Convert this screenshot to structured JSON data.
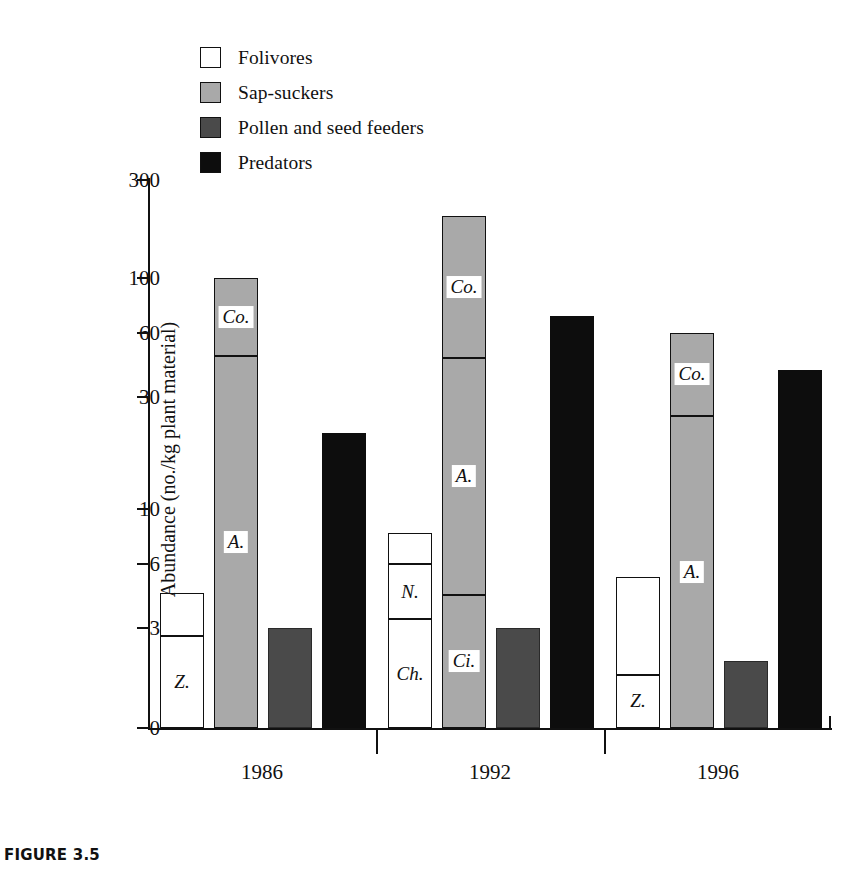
{
  "caption": "FIGURE 3.5",
  "legend": {
    "position": "top-left",
    "items": [
      {
        "label": "Folivores",
        "color": "#ffffff",
        "swatch": "sw-white"
      },
      {
        "label": "Sap-suckers",
        "color": "#a9a9a9",
        "swatch": "sw-light"
      },
      {
        "label": "Pollen and seed feeders",
        "color": "#4a4a4a",
        "swatch": "sw-dark"
      },
      {
        "label": "Predators",
        "color": "#0d0d0d",
        "swatch": "sw-black"
      }
    ]
  },
  "chart_data": {
    "type": "bar",
    "title": "",
    "xlabel": "Year",
    "ylabel": "Abundance (no./kg plant material)",
    "yscale": "log-like",
    "ytick_labels": [
      "300",
      "100",
      "60",
      "30",
      "10",
      "6",
      "3",
      "0"
    ],
    "ytick_values": [
      300,
      100,
      60,
      30,
      10,
      6,
      3,
      0
    ],
    "ylim": [
      0,
      300
    ],
    "grid": false,
    "categories": [
      "1986",
      "1992",
      "1996"
    ],
    "series": [
      {
        "name": "Folivores",
        "color": "#ffffff",
        "values": [
          4.4,
          8.0,
          5.2
        ]
      },
      {
        "name": "Sap-suckers",
        "color": "#a9a9a9",
        "values": [
          100,
          200,
          60
        ]
      },
      {
        "name": "Pollen and seed feeders",
        "color": "#4a4a4a",
        "values": [
          3.0,
          3.0,
          2.0
        ]
      },
      {
        "name": "Predators",
        "color": "#0d0d0d",
        "values": [
          21,
          70,
          40
        ]
      }
    ],
    "stacked_segments": {
      "1986": {
        "Folivores": [
          {
            "label": "Z.",
            "from": 0,
            "to": 2.75
          },
          {
            "label": "",
            "from": 2.75,
            "to": 4.4
          }
        ],
        "Sap-suckers": [
          {
            "label": "A.",
            "from": 0,
            "to": 47
          },
          {
            "label": "Co.",
            "from": 47,
            "to": 100
          }
        ],
        "Pollen and seed feeders": [
          {
            "label": "",
            "from": 0,
            "to": 3.0
          }
        ],
        "Predators": [
          {
            "label": "",
            "from": 0,
            "to": 21
          }
        ]
      },
      "1992": {
        "Folivores": [
          {
            "label": "Ch.",
            "from": 0,
            "to": 3.3
          },
          {
            "label": "N.",
            "from": 3.3,
            "to": 6.0
          },
          {
            "label": "",
            "from": 6.0,
            "to": 8.0
          }
        ],
        "Sap-suckers": [
          {
            "label": "Ci.",
            "from": 0,
            "to": 4.3
          },
          {
            "label": "A.",
            "from": 4.3,
            "to": 46
          },
          {
            "label": "Co.",
            "from": 46,
            "to": 200
          }
        ],
        "Pollen and seed feeders": [
          {
            "label": "",
            "from": 0,
            "to": 3.0
          }
        ],
        "Predators": [
          {
            "label": "",
            "from": 0,
            "to": 70
          }
        ]
      },
      "1996": {
        "Folivores": [
          {
            "label": "Z.",
            "from": 0,
            "to": 1.6
          },
          {
            "label": "",
            "from": 1.6,
            "to": 5.2
          }
        ],
        "Sap-suckers": [
          {
            "label": "A.",
            "from": 0,
            "to": 25
          },
          {
            "label": "Co.",
            "from": 25,
            "to": 60
          }
        ],
        "Pollen and seed feeders": [
          {
            "label": "",
            "from": 0,
            "to": 2.0
          }
        ],
        "Predators": [
          {
            "label": "",
            "from": 0,
            "to": 40
          }
        ]
      }
    }
  }
}
